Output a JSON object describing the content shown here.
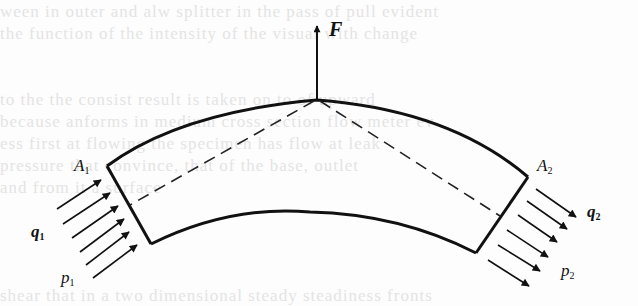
{
  "figure": {
    "colors": {
      "stroke": "#111111",
      "background": "#fdfdfd",
      "bleed_text": "#e4e4e4"
    }
  },
  "labels": {
    "force": "F",
    "inlet_area": {
      "base": "A",
      "sub": "1"
    },
    "outlet_area": {
      "base": "A",
      "sub": "2"
    },
    "inlet_flow": {
      "base": "q",
      "sub": "1"
    },
    "inlet_pressure": {
      "base": "p",
      "sub": "1"
    },
    "outlet_flow": {
      "base": "q",
      "sub": "2"
    },
    "outlet_pressure": {
      "base": "p",
      "sub": "2"
    }
  },
  "bleed_through_text": [
    "ween in outer and alw splitter in the pass of pull evident",
    "the function of the intensity of the visual with change",
    "",
    "",
    "to the the consist result is taken on to of upward",
    "because anforms in medium cross section flow meter ev",
    "ess first at flowing the specimen has flow at leak",
    "pressure that convince, that of the base, outlet",
    "and from it a surface",
    "",
    "shear that in a two dimensional steady steadiness fronts"
  ],
  "inlet_arrows": [
    {
      "x1": 57,
      "y1": 209,
      "x2": 101,
      "y2": 180
    },
    {
      "x1": 63,
      "y1": 224,
      "x2": 110,
      "y2": 193
    },
    {
      "x1": 72,
      "y1": 238,
      "x2": 118,
      "y2": 206
    },
    {
      "x1": 80,
      "y1": 252,
      "x2": 124,
      "y2": 219
    },
    {
      "x1": 86,
      "y1": 265,
      "x2": 129,
      "y2": 232
    },
    {
      "x1": 93,
      "y1": 278,
      "x2": 137,
      "y2": 245
    }
  ],
  "outlet_arrows": [
    {
      "x1": 536,
      "y1": 189,
      "x2": 576,
      "y2": 217
    },
    {
      "x1": 527,
      "y1": 201,
      "x2": 567,
      "y2": 229
    },
    {
      "x1": 518,
      "y1": 215,
      "x2": 557,
      "y2": 242
    },
    {
      "x1": 507,
      "y1": 230,
      "x2": 548,
      "y2": 257
    },
    {
      "x1": 498,
      "y1": 245,
      "x2": 540,
      "y2": 271
    },
    {
      "x1": 488,
      "y1": 260,
      "x2": 529,
      "y2": 286
    }
  ]
}
